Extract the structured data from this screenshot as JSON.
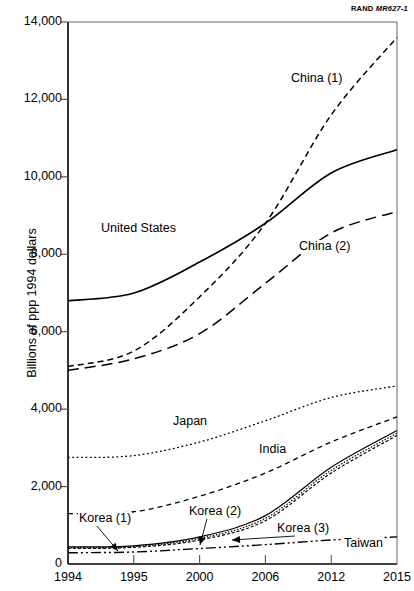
{
  "credit": {
    "org": "RAND",
    "doc": "MR627-1"
  },
  "chart_data": {
    "type": "line",
    "title": "",
    "xlabel": "",
    "ylabel": "Billions of ppp 1994 dollars",
    "xticks": [
      "1994",
      "1995",
      "2000",
      "2006",
      "2012",
      "2015"
    ],
    "yticks": [
      "0",
      "2,000",
      "4,000",
      "6,000",
      "8,000",
      "10,000",
      "12,000",
      "14,000"
    ],
    "ytick_values": [
      0,
      2000,
      4000,
      6000,
      8000,
      10000,
      12000,
      14000
    ],
    "ylim": [
      0,
      14000
    ],
    "grid": false,
    "legend_position": "inline-annotations",
    "x": [
      1994,
      1995,
      2000,
      2006,
      2012,
      2015
    ],
    "series": [
      {
        "name": "China (1)",
        "label": "China (1)",
        "style": "dashed-short",
        "values": [
          5100,
          5500,
          6900,
          8800,
          11600,
          13600
        ]
      },
      {
        "name": "United States",
        "label": "United States",
        "style": "solid",
        "values": [
          6800,
          7000,
          7800,
          8800,
          10100,
          10700
        ]
      },
      {
        "name": "China (2)",
        "label": "China (2)",
        "style": "dashed-long",
        "values": [
          5000,
          5300,
          5950,
          7250,
          8550,
          9100
        ]
      },
      {
        "name": "Japan",
        "label": "Japan",
        "style": "dotted",
        "values": [
          2750,
          2800,
          3150,
          3700,
          4300,
          4600
        ]
      },
      {
        "name": "India",
        "label": "India",
        "style": "dashed-medium",
        "values": [
          1300,
          1350,
          1750,
          2350,
          3150,
          3800
        ]
      },
      {
        "name": "Korea (1)",
        "label": "Korea (1)",
        "style": "solid-thin",
        "values": [
          440,
          470,
          700,
          1250,
          2500,
          3450
        ]
      },
      {
        "name": "Korea (2)",
        "label": "Korea (2)",
        "style": "dotted-thin",
        "values": [
          420,
          450,
          660,
          1180,
          2420,
          3380
        ]
      },
      {
        "name": "Korea (3)",
        "label": "Korea (3)",
        "style": "dashed-thin",
        "values": [
          400,
          430,
          620,
          1120,
          2350,
          3320
        ]
      },
      {
        "name": "Taiwan",
        "label": "Taiwan",
        "style": "dash-dot-dot",
        "values": [
          290,
          310,
          400,
          500,
          620,
          700
        ]
      }
    ],
    "annotations": [
      {
        "text": "China (1)",
        "x": 1994,
        "y": 0
      },
      {
        "text": "United States",
        "x": 1994,
        "y": 0
      },
      {
        "text": "China (2)",
        "x": 1994,
        "y": 0
      },
      {
        "text": "Japan",
        "x": 1994,
        "y": 0
      },
      {
        "text": "India",
        "x": 1994,
        "y": 0
      },
      {
        "text": "Korea (1)",
        "x": 1994,
        "y": 0
      },
      {
        "text": "Korea (2)",
        "x": 1994,
        "y": 0
      },
      {
        "text": "Korea (3)",
        "x": 1994,
        "y": 0
      },
      {
        "text": "Taiwan",
        "x": 1994,
        "y": 0
      }
    ]
  }
}
